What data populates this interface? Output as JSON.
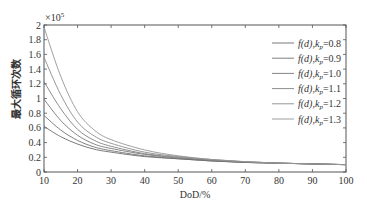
{
  "chart_data": {
    "type": "line",
    "title": "",
    "xlabel": "DoD/%",
    "ylabel": "最大循环次数",
    "y_multiplier": "×10^5",
    "xlim": [
      10,
      100
    ],
    "ylim": [
      0,
      2
    ],
    "x_ticks": [
      10,
      20,
      30,
      40,
      50,
      60,
      70,
      80,
      90,
      100
    ],
    "y_ticks": [
      0,
      0.2,
      0.4,
      0.6,
      0.8,
      1,
      1.2,
      1.4,
      1.6,
      1.8,
      2
    ],
    "grid": false,
    "legend_position": "upper right",
    "x": [
      10,
      15,
      20,
      25,
      30,
      40,
      50,
      60,
      70,
      80,
      90,
      100
    ],
    "series": [
      {
        "name": "f(d),kp=0.8",
        "values": [
          0.62,
          0.48,
          0.38,
          0.31,
          0.27,
          0.21,
          0.18,
          0.15,
          0.13,
          0.12,
          0.11,
          0.1
        ]
      },
      {
        "name": "f(d),kp=0.9",
        "values": [
          0.77,
          0.57,
          0.43,
          0.34,
          0.29,
          0.22,
          0.18,
          0.15,
          0.13,
          0.12,
          0.11,
          0.1
        ]
      },
      {
        "name": "f(d),kp=1.0",
        "values": [
          0.99,
          0.7,
          0.5,
          0.38,
          0.32,
          0.24,
          0.19,
          0.16,
          0.13,
          0.12,
          0.11,
          0.1
        ]
      },
      {
        "name": "f(d),kp=1.1",
        "values": [
          1.23,
          0.86,
          0.58,
          0.43,
          0.35,
          0.25,
          0.2,
          0.16,
          0.14,
          0.12,
          0.11,
          0.1
        ]
      },
      {
        "name": "f(d),kp=1.2",
        "values": [
          1.56,
          1.05,
          0.68,
          0.49,
          0.39,
          0.27,
          0.21,
          0.17,
          0.14,
          0.12,
          0.11,
          0.1
        ]
      },
      {
        "name": "f(d),kp=1.3",
        "values": [
          1.97,
          1.3,
          0.82,
          0.57,
          0.44,
          0.3,
          0.22,
          0.17,
          0.14,
          0.12,
          0.11,
          0.1
        ]
      }
    ]
  },
  "legend": {
    "items": [
      {
        "func": "f(d),",
        "k": "k",
        "sub": "p",
        "value": "=0.8"
      },
      {
        "func": "f(d),",
        "k": "k",
        "sub": "p",
        "value": "=0.9"
      },
      {
        "func": "f(d),",
        "k": "k",
        "sub": "p",
        "value": "=1.0"
      },
      {
        "func": "f(d),",
        "k": "k",
        "sub": "p",
        "value": "=1.1"
      },
      {
        "func": "f(d),",
        "k": "k",
        "sub": "p",
        "value": "=1.2"
      },
      {
        "func": "f(d),",
        "k": "k",
        "sub": "p",
        "value": "=1.3"
      }
    ]
  },
  "colors": {
    "axis": "#555555",
    "series": [
      "#6a6a6a",
      "#707070",
      "#777777",
      "#808080",
      "#8a8a8a",
      "#949494"
    ]
  }
}
